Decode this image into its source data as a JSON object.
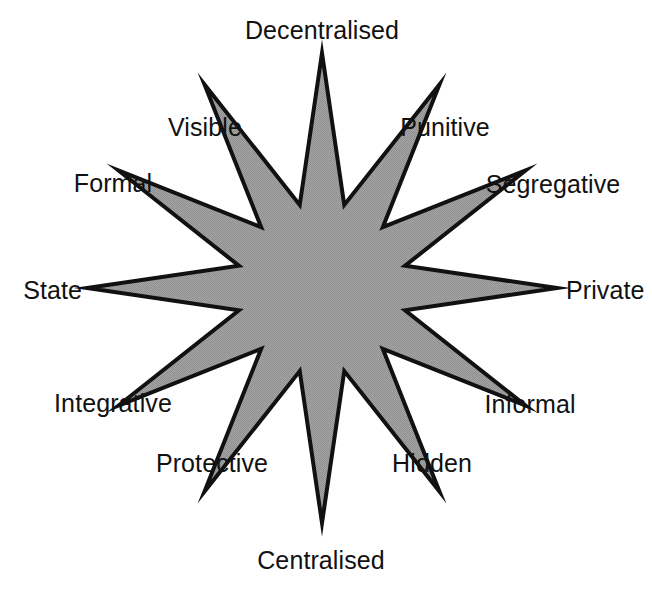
{
  "figure": {
    "kind": "twelve-point-star-diagram",
    "background_color": "#ffffff",
    "star": {
      "fill_color": "#9a9a9a",
      "stroke_color": "#111111",
      "stroke_width": 4,
      "points": 12,
      "center_x": 322,
      "center_y": 288,
      "outer_radius": 235,
      "inner_radius": 86,
      "start_angle_deg": 90
    }
  },
  "labels": [
    {
      "id": "decentralised",
      "text": "Decentralised",
      "angle_deg": 90,
      "x": 322,
      "y": 30,
      "anchor": "center"
    },
    {
      "id": "punitive",
      "text": "Punitive",
      "angle_deg": 60,
      "x": 445,
      "y": 127,
      "anchor": "center"
    },
    {
      "id": "segregative",
      "text": "Segregative",
      "angle_deg": 30,
      "x": 553,
      "y": 184,
      "anchor": "center"
    },
    {
      "id": "private",
      "text": "Private",
      "angle_deg": 0,
      "x": 566,
      "y": 290,
      "anchor": "left"
    },
    {
      "id": "informal",
      "text": "Informal",
      "angle_deg": -30,
      "x": 530,
      "y": 404,
      "anchor": "center"
    },
    {
      "id": "hidden",
      "text": "Hidden",
      "angle_deg": -60,
      "x": 432,
      "y": 463,
      "anchor": "center"
    },
    {
      "id": "centralised",
      "text": "Centralised",
      "angle_deg": -90,
      "x": 321,
      "y": 560,
      "anchor": "center"
    },
    {
      "id": "protective",
      "text": "Protective",
      "angle_deg": -120,
      "x": 212,
      "y": 463,
      "anchor": "center"
    },
    {
      "id": "integrative",
      "text": "Integrative",
      "angle_deg": -150,
      "x": 113,
      "y": 403,
      "anchor": "center"
    },
    {
      "id": "state",
      "text": "State",
      "angle_deg": 180,
      "x": 82,
      "y": 290,
      "anchor": "right"
    },
    {
      "id": "formal",
      "text": "Formal",
      "angle_deg": 150,
      "x": 113,
      "y": 183,
      "anchor": "center"
    },
    {
      "id": "visible",
      "text": "Visible",
      "angle_deg": 120,
      "x": 205,
      "y": 127,
      "anchor": "center"
    }
  ],
  "chart_data": {
    "type": "radar",
    "title": "",
    "categories": [
      "Decentralised",
      "Punitive",
      "Segregative",
      "Private",
      "Informal",
      "Hidden",
      "Centralised",
      "Protective",
      "Integrative",
      "State",
      "Formal",
      "Visible"
    ],
    "values": [
      1,
      1,
      1,
      1,
      1,
      1,
      1,
      1,
      1,
      1,
      1,
      1
    ],
    "xlabel": "",
    "ylabel": "",
    "legend_position": "none",
    "grid": false
  }
}
